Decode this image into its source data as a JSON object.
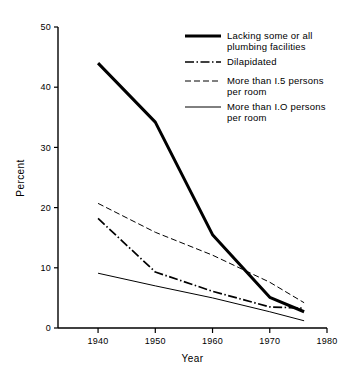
{
  "chart_data": {
    "type": "line",
    "title": "",
    "xlabel": "Year",
    "ylabel": "Percent",
    "xlim": [
      1933,
      1980
    ],
    "ylim": [
      0,
      50
    ],
    "xticks": [
      1940,
      1950,
      1960,
      1970,
      1980
    ],
    "xtick_labels": [
      "1940",
      "1950",
      "1960",
      "1970",
      "1980"
    ],
    "yticks": [
      0,
      10,
      20,
      30,
      40,
      50
    ],
    "ytick_labels": [
      "0",
      "10",
      "20",
      "30",
      "40",
      "50"
    ],
    "grid": false,
    "legend_position": "top-right",
    "series": [
      {
        "name": "Lacking some or all plumbing facilities",
        "legend_label_line1": "Lacking some or all",
        "legend_label_line2": "plumbing facilities",
        "style": "thick-solid",
        "color": "#000000",
        "x": [
          1940,
          1950,
          1960,
          1970,
          1976
        ],
        "values": [
          44.0,
          34.2,
          15.5,
          5.1,
          2.7
        ]
      },
      {
        "name": "Dilapidated",
        "legend_label_line1": "Dilapidated",
        "legend_label_line2": "",
        "style": "dash-dot",
        "color": "#000000",
        "x": [
          1940,
          1950,
          1960,
          1970,
          1976
        ],
        "values": [
          18.2,
          9.3,
          6.1,
          3.5,
          3.3
        ]
      },
      {
        "name": "More than 1.5 persons per room",
        "legend_label_line1": "More than I.5 persons",
        "legend_label_line2": "per room",
        "style": "dashed",
        "color": "#000000",
        "x": [
          1940,
          1950,
          1960,
          1970,
          1976
        ],
        "values": [
          20.7,
          15.9,
          12.1,
          7.6,
          4.2
        ]
      },
      {
        "name": "More than 1.0 persons per room",
        "legend_label_line1": "More than I.O persons",
        "legend_label_line2": "per room",
        "style": "thin-solid",
        "color": "#000000",
        "x": [
          1940,
          1950,
          1960,
          1970,
          1976
        ],
        "values": [
          9.1,
          7.0,
          5.0,
          2.7,
          1.2
        ]
      }
    ]
  }
}
